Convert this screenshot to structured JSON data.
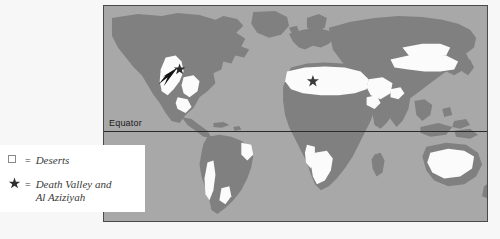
{
  "map": {
    "title": "World Deserts Map",
    "equator_label": "Equator",
    "ocean_color": "#a8a8a8",
    "land_color": "#808080",
    "desert_color": "#fbfbfb",
    "border_color": "#4a4a4a",
    "markers": [
      {
        "name": "death-valley-star",
        "label": "Death Valley",
        "x": 76,
        "y": 64
      },
      {
        "name": "al-aziziyah-star",
        "label": "Al Aziziyah",
        "x": 210,
        "y": 76
      }
    ]
  },
  "legend": {
    "items": [
      {
        "symbol": "square",
        "equals": "=",
        "label": "Deserts"
      },
      {
        "symbol": "star",
        "equals": "=",
        "label": "Death Valley and\nAl Aziziyah"
      }
    ]
  }
}
